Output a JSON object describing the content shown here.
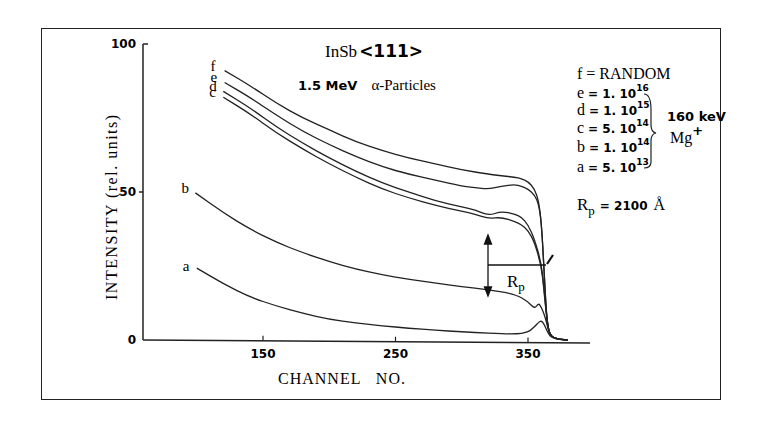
{
  "chart_data": {
    "type": "line",
    "subtitle": "1.5 MeV α-Particles",
    "xlabel": "CHANNEL NO.",
    "ylabel": "INTENSITY (rel. units)",
    "xlim": [
      72,
      400
    ],
    "ylim": [
      0,
      100
    ],
    "x_ticks": [
      150,
      250,
      350
    ],
    "y_ticks": [
      0,
      50,
      100
    ],
    "grid": false,
    "legend_position": "right",
    "series": [
      {
        "name": "f",
        "label": "f = RANDOM",
        "x": [
          121,
          140,
          160,
          180,
          200,
          220,
          240,
          260,
          280,
          300,
          320,
          330,
          340,
          345,
          350,
          355,
          358,
          360,
          362,
          364,
          366,
          370,
          380
        ],
        "values": [
          91,
          86,
          80,
          75,
          71,
          67,
          64,
          61.5,
          59.5,
          57.5,
          56,
          55.5,
          55,
          54.5,
          53.5,
          51,
          47,
          40,
          25,
          8,
          2,
          0.5,
          0
        ]
      },
      {
        "name": "e",
        "label": "e = 1.10^16",
        "x": [
          121,
          140,
          160,
          180,
          200,
          220,
          240,
          260,
          280,
          300,
          310,
          320,
          330,
          340,
          345,
          350,
          355,
          358,
          360,
          362,
          364,
          366,
          370,
          380
        ],
        "values": [
          87,
          82,
          76,
          70.5,
          66,
          62,
          58.5,
          56,
          54,
          52,
          51.5,
          51,
          52,
          52.5,
          52,
          51,
          49,
          46,
          40,
          25,
          8,
          2,
          0.5,
          0
        ]
      },
      {
        "name": "d",
        "label": "d = 1.10^15",
        "x": [
          120,
          140,
          160,
          180,
          200,
          220,
          240,
          260,
          280,
          300,
          310,
          320,
          330,
          340,
          345,
          350,
          355,
          360,
          362,
          364,
          366,
          370,
          380
        ],
        "values": [
          84,
          78.5,
          72,
          66.5,
          61.5,
          57,
          53,
          50,
          47,
          45,
          44,
          42,
          43.5,
          42.5,
          41.5,
          39,
          34,
          26,
          18,
          8,
          2,
          0.5,
          0
        ]
      },
      {
        "name": "c",
        "label": "c = 5.10^14",
        "x": [
          120,
          140,
          160,
          180,
          200,
          220,
          240,
          260,
          280,
          300,
          310,
          320,
          330,
          340,
          345,
          350,
          355,
          360,
          362,
          364,
          366,
          370,
          380
        ],
        "values": [
          82,
          76.5,
          70,
          64.5,
          59.5,
          55,
          51,
          48,
          45.5,
          43.5,
          42.5,
          41,
          41.5,
          40,
          39,
          37,
          33,
          25,
          17,
          8,
          2,
          0.5,
          0
        ]
      },
      {
        "name": "b",
        "label": "b = 1.10^14",
        "x": [
          99,
          120,
          140,
          160,
          180,
          200,
          220,
          240,
          260,
          280,
          300,
          320,
          340,
          350,
          355,
          358,
          360,
          362,
          364,
          366,
          370,
          380
        ],
        "values": [
          49.7,
          43,
          37.5,
          33,
          29.5,
          26.5,
          24,
          22,
          20.5,
          19.3,
          18,
          17,
          15.5,
          13,
          10.5,
          12.5,
          11,
          9,
          6,
          2,
          0.5,
          0
        ]
      },
      {
        "name": "a",
        "label": "a = 5.10^13",
        "x": [
          100,
          120,
          140,
          160,
          180,
          200,
          220,
          240,
          260,
          280,
          300,
          320,
          340,
          350,
          355,
          358,
          360,
          362,
          364,
          366,
          370,
          380
        ],
        "values": [
          24.3,
          19,
          14.5,
          11.5,
          9,
          7,
          5.8,
          4.8,
          4,
          3.3,
          2.8,
          2.3,
          2,
          2.5,
          4.5,
          6,
          6.5,
          5.5,
          3.5,
          1.5,
          0.3,
          0
        ]
      }
    ],
    "annotations": {
      "legend_lines": [
        "f = RANDOM",
        "e = 1. 10^16",
        "d = 1. 10^15",
        "c = 5. 10^14",
        "b = 1. 10^14",
        "a = 5. 10^13"
      ],
      "bracket_label_1": "160 keV",
      "bracket_label_2": "Mg+",
      "rp_label": "Rp",
      "rp_value": "Rp = 2100 Å"
    }
  },
  "labels": {
    "title_main": "InSb",
    "title_dir": "<111>",
    "subtitle_energy": "1.5 MeV",
    "subtitle_particle": "α-Particles",
    "xlabel": "CHANNEL   NO.",
    "ylabel": "INTENSITY (rel. units)",
    "legend": {
      "f": {
        "key": "f",
        "eq": "= RANDOM"
      },
      "e": {
        "key": "e",
        "mant": "= 1. 10",
        "exp": "16"
      },
      "d": {
        "key": "d",
        "mant": "= 1. 10",
        "exp": "15"
      },
      "c": {
        "key": "c",
        "mant": "= 5. 10",
        "exp": "14"
      },
      "b": {
        "key": "b",
        "mant": "= 1. 10",
        "exp": "14"
      },
      "a": {
        "key": "a",
        "mant": "= 5. 10",
        "exp": "13"
      }
    },
    "bracket_energy": "160 keV",
    "bracket_ion": "Mg",
    "bracket_ion_charge": "+",
    "rp_text_r": "R",
    "rp_text_sub": "p",
    "rp_eq": "= 2100",
    "rp_unit": "Å"
  }
}
